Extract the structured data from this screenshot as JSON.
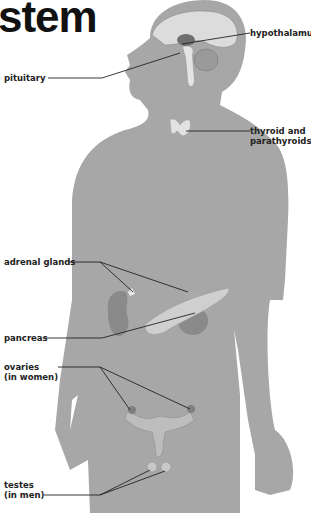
{
  "title": "stem",
  "labels": {
    "pituitary": "pituitary",
    "hypothalamus": "hypothalamus",
    "thyroid_line1": "thyroid and",
    "thyroid_line2": "parathyroids",
    "adrenal": "adrenal glands",
    "pancreas": "pancreas",
    "ovaries_line1": "ovaries",
    "ovaries_line2": "(in women)",
    "testes_line1": "testes",
    "testes_line2": "(in men)"
  },
  "colors": {
    "silhouette": "#a7a7a7",
    "organ": "#8c8c8c",
    "organ_light": "#d8d8d8",
    "leader": "#222222"
  }
}
